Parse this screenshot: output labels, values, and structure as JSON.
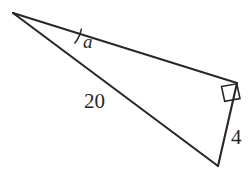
{
  "figure": {
    "name": "right-triangle-diagram",
    "background_color": "#ffffff",
    "stroke_color": "#272727",
    "labels": {
      "angle": "a",
      "hypotenuse": "20",
      "opposite_side": "4"
    },
    "markers": {
      "right_angle": "right-angle-square"
    },
    "geometry": {
      "apex_vertex": [
        13,
        13
      ],
      "right_angle_vertex": [
        237,
        83
      ],
      "bottom_vertex": [
        218,
        166
      ],
      "angle_arc_start": [
        74,
        43
      ],
      "angle_arc_end": [
        81,
        29
      ],
      "right_angle_square": [
        [
          222,
          86
        ],
        [
          237,
          83
        ],
        [
          240,
          98
        ],
        [
          225,
          101
        ]
      ]
    }
  }
}
